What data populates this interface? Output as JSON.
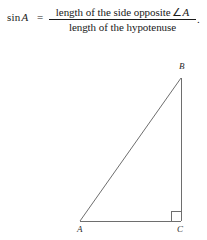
{
  "formula": {
    "function_name": "sin",
    "angle_variable": "A",
    "equals": "=",
    "numerator_text": "length of the side opposite",
    "angle_symbol": "∠",
    "numerator_variable": "A",
    "denominator_text": "length of the hypotenuse",
    "terminal_punctuation": "."
  },
  "figure": {
    "type": "right-triangle",
    "vertices": [
      {
        "name": "A",
        "label": "A",
        "x": 80,
        "y": 221,
        "angle_role": "reference-angle"
      },
      {
        "name": "B",
        "label": "B",
        "x": 181,
        "y": 78,
        "angle_role": "acute"
      },
      {
        "name": "C",
        "label": "C",
        "x": 181,
        "y": 221,
        "angle_role": "right-angle"
      }
    ],
    "sides": [
      {
        "name": "hypotenuse",
        "from": "A",
        "to": "B"
      },
      {
        "name": "opposite-side",
        "from": "B",
        "to": "C"
      },
      {
        "name": "adjacent-side",
        "from": "A",
        "to": "C"
      }
    ],
    "right_angle_marker": {
      "at": "C",
      "size": 10
    },
    "stroke_color": "#6e6e6e",
    "stroke_width": 1
  }
}
